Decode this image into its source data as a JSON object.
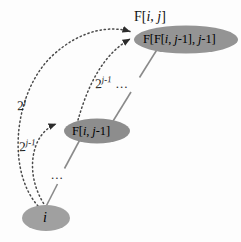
{
  "figure": {
    "name": "recursive-doubling-diagram",
    "background_color": "#fdfdfd",
    "node_fill_color": "#8f8f8f",
    "node_fill_color_light": "#a3a3a3",
    "arrow_color": "#3a3a3a",
    "solid_line_color": "#7a7a7a",
    "width": 241,
    "height": 242
  },
  "nodes": {
    "top": {
      "label": "F[F[i, j-1], j-1]",
      "label_parts": {
        "prefix": "F[F[",
        "var1": "i",
        "mid": ", ",
        "var2": "j",
        "sub1": "-1], ",
        "var3": "j",
        "suffix": "-1]"
      },
      "caption": "F[i, j]",
      "caption_parts": {
        "prefix": "F[",
        "var1": "i",
        "mid": ", ",
        "var2": "j",
        "suffix": "]"
      }
    },
    "middle": {
      "label": "F[i, j-1]",
      "label_parts": {
        "prefix": "F[",
        "var1": "i",
        "mid": ", ",
        "var2": "j",
        "suffix": "-1]"
      }
    },
    "bottom": {
      "label": "i"
    }
  },
  "edge_labels": {
    "pow_j": {
      "base": "2",
      "exponent": "j"
    },
    "pow_j_minus_1_lower": {
      "base": "2",
      "exponent": "j-1"
    },
    "pow_j_minus_1_upper": {
      "base": "2",
      "exponent": "j-1",
      "trailing": "..."
    }
  },
  "ellipses": {
    "vertical_dots_bottom": "...",
    "horizontal_dots_upper": "..."
  }
}
